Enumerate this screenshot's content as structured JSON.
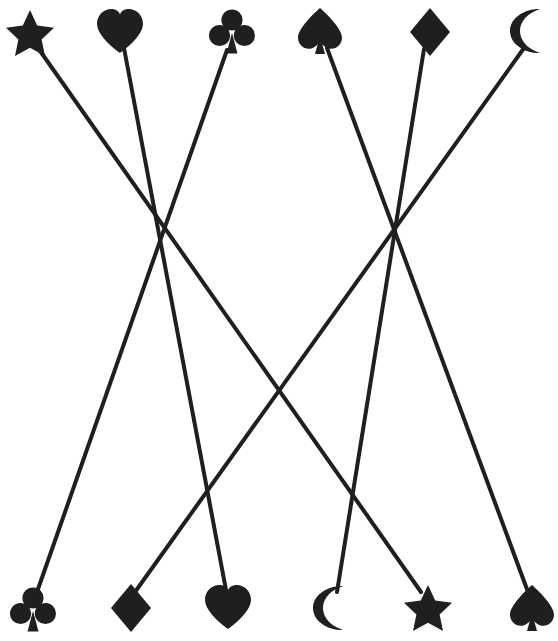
{
  "canvas": {
    "width": 558,
    "height": 641,
    "background": "#ffffff",
    "ink": "#1a1a1a"
  },
  "diagram": {
    "type": "bipartite-matching",
    "line_color": "#1f1f1f",
    "line_width": 4,
    "top_row": [
      {
        "id": "t1",
        "icon": "star-icon",
        "label": "star",
        "x": 30,
        "y": 33
      },
      {
        "id": "t2",
        "icon": "heart-icon",
        "label": "heart",
        "x": 120,
        "y": 31
      },
      {
        "id": "t3",
        "icon": "club-icon",
        "label": "club",
        "x": 232,
        "y": 32
      },
      {
        "id": "t4",
        "icon": "spade-icon",
        "label": "spade",
        "x": 320,
        "y": 31
      },
      {
        "id": "t5",
        "icon": "diamond-icon",
        "label": "diamond",
        "x": 430,
        "y": 32
      },
      {
        "id": "t6",
        "icon": "moon-icon",
        "label": "moon",
        "x": 530,
        "y": 31
      }
    ],
    "bottom_row": [
      {
        "id": "b1",
        "icon": "club-icon",
        "label": "club",
        "x": 33,
        "y": 610
      },
      {
        "id": "b2",
        "icon": "diamond-icon",
        "label": "diamond",
        "x": 131,
        "y": 608
      },
      {
        "id": "b3",
        "icon": "heart-icon",
        "label": "heart",
        "x": 228,
        "y": 607
      },
      {
        "id": "b4",
        "icon": "moon-icon",
        "label": "moon",
        "x": 333,
        "y": 608
      },
      {
        "id": "b5",
        "icon": "star-icon",
        "label": "star",
        "x": 428,
        "y": 608
      },
      {
        "id": "b6",
        "icon": "spade-icon",
        "label": "spade",
        "x": 532,
        "y": 608
      }
    ],
    "edges": [
      {
        "from": "t1",
        "to": "b5",
        "x1": 38,
        "y1": 48,
        "x2": 421,
        "y2": 592,
        "from_label": "star",
        "to_label": "star"
      },
      {
        "from": "t2",
        "to": "b3",
        "x1": 124,
        "y1": 48,
        "x2": 226,
        "y2": 590,
        "from_label": "heart",
        "to_label": "heart"
      },
      {
        "from": "t3",
        "to": "b1",
        "x1": 227,
        "y1": 50,
        "x2": 37,
        "y2": 592,
        "from_label": "club",
        "to_label": "club"
      },
      {
        "from": "t4",
        "to": "b6",
        "x1": 327,
        "y1": 48,
        "x2": 528,
        "y2": 592,
        "from_label": "spade",
        "to_label": "spade"
      },
      {
        "from": "t5",
        "to": "b4",
        "x1": 424,
        "y1": 49,
        "x2": 337,
        "y2": 592,
        "from_label": "diamond",
        "to_label": "moon"
      },
      {
        "from": "t6",
        "to": "b2",
        "x1": 524,
        "y1": 48,
        "x2": 135,
        "y2": 592,
        "from_label": "moon",
        "to_label": "diamond"
      }
    ],
    "crossings": [
      {
        "x": 163,
        "y": 226,
        "lines": 3
      },
      {
        "x": 430,
        "y": 320,
        "lines": 2
      },
      {
        "x": 205,
        "y": 465,
        "lines": 2
      },
      {
        "x": 375,
        "y": 380,
        "lines": 2
      }
    ]
  }
}
